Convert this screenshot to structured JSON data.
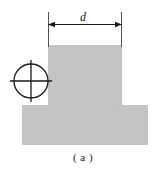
{
  "figure": {
    "caption": "( a )",
    "caption_x": 83,
    "caption_y": 157,
    "background_color": "#ffffff",
    "line_color": "#1a1a1a",
    "shape": {
      "name": "t-shaped-cross-section",
      "fill_color": "#c4c4c4",
      "stem": {
        "left": 48,
        "right": 122,
        "top": 45,
        "bottom": 105,
        "width": 74,
        "height": 60
      },
      "base": {
        "left": 22,
        "right": 148,
        "top": 105,
        "bottom": 145,
        "width": 126,
        "height": 40
      }
    },
    "dimension": {
      "label": "d",
      "label_x": 83,
      "label_y": 17,
      "line_y": 24,
      "start_x": 48,
      "end_x": 122,
      "extension_top_y": 12,
      "extension_bottom_y": 47,
      "arrow_size": 5
    },
    "centroid_marker": {
      "name": "centroid-symbol",
      "center_x": 31,
      "center_y": 81,
      "radius": 17,
      "cross_overhang": 4
    }
  }
}
